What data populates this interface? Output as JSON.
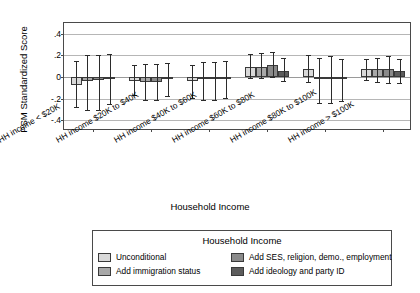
{
  "chart_data": {
    "type": "bar",
    "title": "",
    "xlabel": "Household Income",
    "ylabel": "PSM Standardized Score",
    "legend_title": "Household Income",
    "legend_position": "bottom",
    "grid": true,
    "ylim": [
      -0.5,
      0.5
    ],
    "yticks": [
      ".4",
      ".2",
      "0",
      "-.2",
      "-.4"
    ],
    "ytick_values": [
      0.4,
      0.2,
      0,
      -0.2,
      -0.4
    ],
    "categories": [
      "HH income < $20K",
      "HH income $20K to $40K",
      "HH income $40K to $60K",
      "HH income $60K to $80K",
      "HH income $80K to $100K",
      "HH income > $100K"
    ],
    "series": [
      {
        "name": "Unconditional",
        "color": "#d9d9d9",
        "values": [
          -0.07,
          -0.04,
          -0.04,
          0.09,
          0.07,
          0.07
        ],
        "ci_low": [
          -0.28,
          -0.17,
          -0.19,
          -0.01,
          -0.05,
          -0.03
        ],
        "ci_high": [
          0.15,
          0.11,
          0.11,
          0.21,
          0.2,
          0.17
        ]
      },
      {
        "name": "Add immigration status",
        "color": "#a8a8a8",
        "values": [
          -0.04,
          -0.05,
          -0.02,
          0.09,
          -0.02,
          0.07
        ],
        "ci_low": [
          -0.31,
          -0.21,
          -0.21,
          -0.01,
          -0.24,
          -0.05
        ],
        "ci_high": [
          0.2,
          0.12,
          0.14,
          0.22,
          0.18,
          0.18
        ]
      },
      {
        "name": "Add SES, religion, demo., employment",
        "color": "#8a8a8a",
        "values": [
          -0.03,
          -0.05,
          -0.02,
          0.11,
          -0.02,
          0.07
        ],
        "ci_low": [
          -0.31,
          -0.21,
          -0.21,
          0.0,
          -0.24,
          -0.06
        ],
        "ci_high": [
          0.2,
          0.12,
          0.14,
          0.23,
          0.19,
          0.19
        ]
      },
      {
        "name": "Add ideology and party ID",
        "color": "#5c5c5c",
        "values": [
          -0.01,
          -0.02,
          -0.01,
          0.06,
          -0.02,
          0.06
        ],
        "ci_low": [
          -0.25,
          -0.18,
          -0.19,
          -0.04,
          -0.22,
          -0.06
        ],
        "ci_high": [
          0.21,
          0.13,
          0.15,
          0.18,
          0.17,
          0.17
        ]
      }
    ]
  },
  "legend": {
    "title": "Household Income",
    "items": [
      {
        "label": "Unconditional"
      },
      {
        "label": "Add immigration status"
      },
      {
        "label": "Add SES, religion, demo., employment"
      },
      {
        "label": "Add ideology and party ID"
      }
    ]
  },
  "axes": {
    "y_title": "PSM Standardized Score",
    "x_title": "Household Income"
  }
}
